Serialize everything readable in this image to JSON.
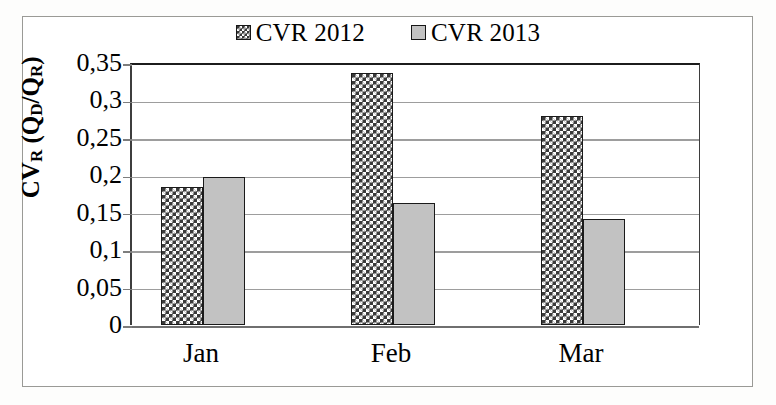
{
  "chart_data": {
    "type": "bar",
    "title": "",
    "xlabel": "",
    "ylabel": "CVR (QD/QR)",
    "ylabel_parts": {
      "main_1": "CV",
      "sub_1": "R",
      "main_2": " (Q",
      "sub_2": "D",
      "main_3": "/Q",
      "sub_3": "R",
      "main_4": ")"
    },
    "categories": [
      "Jan",
      "Feb",
      "Mar"
    ],
    "series": [
      {
        "name": "CVR 2012",
        "values": [
          0.185,
          0.337,
          0.279
        ],
        "fill": "checker-hatch",
        "color": "#3a3a3a"
      },
      {
        "name": "CVR 2013",
        "values": [
          0.198,
          0.163,
          0.141
        ],
        "fill": "solid",
        "color": "#c2c2c2"
      }
    ],
    "ylim": [
      0,
      0.35
    ],
    "ytick_step": 0.05,
    "ytick_labels": [
      "0",
      "0,05",
      "0,1",
      "0,15",
      "0,2",
      "0,25",
      "0,3",
      "0,35"
    ],
    "ytick_values": [
      0,
      0.05,
      0.1,
      0.15,
      0.2,
      0.25,
      0.3,
      0.35
    ],
    "decimal_separator": ",",
    "grid": true,
    "grid_axis": "y",
    "legend_position": "top-center"
  },
  "legend": {
    "entries": [
      {
        "label": "CVR 2012",
        "swatch": "checker-hatch-swatch"
      },
      {
        "label": "CVR 2013",
        "swatch": "solid-gray-swatch"
      }
    ]
  },
  "colors": {
    "series_2012": "#3a3a3a",
    "series_2013": "#c2c2c2",
    "gridline": "#9d9d9d",
    "axis": "#1c1c1c",
    "frame_border": "#9a9a96",
    "background": "#ffffff"
  }
}
